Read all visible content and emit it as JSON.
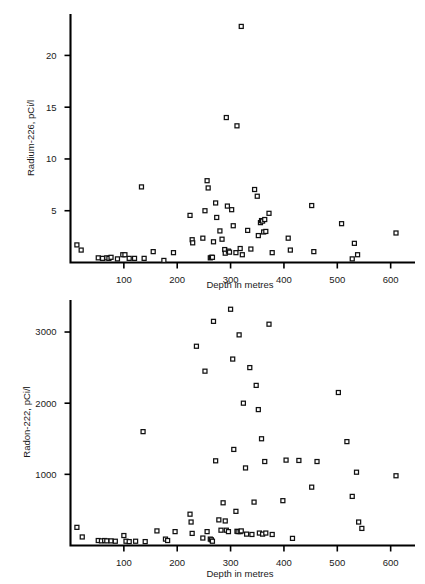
{
  "page": {
    "header_text": "",
    "background": "#ffffff",
    "ink": "#1a1a1a"
  },
  "charts": [
    {
      "id": "radium-226-scatter",
      "name": "radium-226-vs-depth",
      "chart_data": {
        "type": "scatter",
        "title": "",
        "xlabel": "Depth in metres",
        "ylabel": "Radium-226, pCi/l",
        "xlim": [
          0,
          625
        ],
        "ylim": [
          0,
          24
        ],
        "xticks": [
          100,
          200,
          300,
          400,
          500,
          600
        ],
        "yticks": [
          5,
          10,
          15,
          20
        ],
        "grid": false,
        "legend": null,
        "marker": "open-square",
        "points": [
          [
            12,
            1.7
          ],
          [
            20,
            1.2
          ],
          [
            52,
            0.45
          ],
          [
            60,
            0.4
          ],
          [
            68,
            0.45
          ],
          [
            72,
            0.4
          ],
          [
            76,
            0.5
          ],
          [
            88,
            0.35
          ],
          [
            98,
            0.75
          ],
          [
            102,
            0.75
          ],
          [
            110,
            0.4
          ],
          [
            120,
            0.4
          ],
          [
            133,
            7.3
          ],
          [
            138,
            0.4
          ],
          [
            155,
            1.05
          ],
          [
            175,
            0.2
          ],
          [
            193,
            0.95
          ],
          [
            224,
            4.55
          ],
          [
            228,
            2.2
          ],
          [
            229,
            1.9
          ],
          [
            248,
            2.35
          ],
          [
            252,
            5.0
          ],
          [
            256,
            7.9
          ],
          [
            258,
            7.2
          ],
          [
            262,
            0.45
          ],
          [
            264,
            0.5
          ],
          [
            266,
            0.5
          ],
          [
            268,
            2.0
          ],
          [
            272,
            5.75
          ],
          [
            274,
            4.35
          ],
          [
            280,
            3.05
          ],
          [
            284,
            2.25
          ],
          [
            289,
            1.25
          ],
          [
            290,
            0.9
          ],
          [
            292,
            14.0
          ],
          [
            294,
            5.45
          ],
          [
            296,
            1.1
          ],
          [
            298,
            1.0
          ],
          [
            302,
            5.1
          ],
          [
            305,
            3.55
          ],
          [
            310,
            0.95
          ],
          [
            312,
            13.2
          ],
          [
            318,
            1.35
          ],
          [
            320,
            22.8
          ],
          [
            322,
            0.75
          ],
          [
            332,
            3.1
          ],
          [
            338,
            1.3
          ],
          [
            345,
            7.05
          ],
          [
            350,
            6.4
          ],
          [
            352,
            2.6
          ],
          [
            356,
            3.85
          ],
          [
            358,
            4.05
          ],
          [
            360,
            4.0
          ],
          [
            362,
            2.95
          ],
          [
            364,
            4.15
          ],
          [
            366,
            3.0
          ],
          [
            372,
            4.75
          ],
          [
            378,
            0.95
          ],
          [
            408,
            2.35
          ],
          [
            412,
            1.2
          ],
          [
            452,
            5.5
          ],
          [
            456,
            1.05
          ],
          [
            508,
            3.75
          ],
          [
            528,
            0.35
          ],
          [
            532,
            1.85
          ],
          [
            538,
            0.75
          ],
          [
            610,
            2.85
          ]
        ]
      }
    },
    {
      "id": "radon-222-scatter",
      "name": "radon-222-vs-depth",
      "chart_data": {
        "type": "scatter",
        "title": "",
        "xlabel": "Depth in metres",
        "ylabel": "Radon-222, pCi/l",
        "xlim": [
          0,
          625
        ],
        "ylim": [
          0,
          3450
        ],
        "xticks": [
          100,
          200,
          300,
          400,
          500,
          600
        ],
        "yticks": [
          1000,
          2000,
          3000
        ],
        "grid": false,
        "legend": null,
        "marker": "open-square",
        "points": [
          [
            12,
            255
          ],
          [
            22,
            120
          ],
          [
            52,
            70
          ],
          [
            58,
            65
          ],
          [
            64,
            70
          ],
          [
            68,
            65
          ],
          [
            76,
            65
          ],
          [
            84,
            60
          ],
          [
            100,
            140
          ],
          [
            104,
            60
          ],
          [
            110,
            55
          ],
          [
            122,
            60
          ],
          [
            136,
            1600
          ],
          [
            140,
            55
          ],
          [
            162,
            205
          ],
          [
            178,
            90
          ],
          [
            182,
            70
          ],
          [
            196,
            195
          ],
          [
            224,
            440
          ],
          [
            226,
            330
          ],
          [
            228,
            170
          ],
          [
            236,
            2800
          ],
          [
            248,
            105
          ],
          [
            252,
            2450
          ],
          [
            256,
            195
          ],
          [
            262,
            90
          ],
          [
            264,
            80
          ],
          [
            266,
            60
          ],
          [
            268,
            3150
          ],
          [
            272,
            1190
          ],
          [
            278,
            360
          ],
          [
            282,
            215
          ],
          [
            286,
            600
          ],
          [
            290,
            345
          ],
          [
            292,
            215
          ],
          [
            296,
            195
          ],
          [
            300,
            3320
          ],
          [
            304,
            2620
          ],
          [
            306,
            1350
          ],
          [
            310,
            480
          ],
          [
            312,
            200
          ],
          [
            314,
            195
          ],
          [
            316,
            2960
          ],
          [
            318,
            195
          ],
          [
            320,
            205
          ],
          [
            324,
            2000
          ],
          [
            328,
            1090
          ],
          [
            330,
            160
          ],
          [
            336,
            2500
          ],
          [
            340,
            155
          ],
          [
            344,
            610
          ],
          [
            348,
            2250
          ],
          [
            352,
            1910
          ],
          [
            354,
            175
          ],
          [
            358,
            1500
          ],
          [
            360,
            160
          ],
          [
            364,
            1180
          ],
          [
            366,
            175
          ],
          [
            372,
            3110
          ],
          [
            378,
            155
          ],
          [
            398,
            630
          ],
          [
            404,
            1200
          ],
          [
            416,
            100
          ],
          [
            428,
            1195
          ],
          [
            452,
            820
          ],
          [
            462,
            1180
          ],
          [
            502,
            2150
          ],
          [
            518,
            1460
          ],
          [
            528,
            690
          ],
          [
            536,
            1030
          ],
          [
            540,
            330
          ],
          [
            546,
            240
          ],
          [
            610,
            980
          ]
        ]
      }
    }
  ]
}
